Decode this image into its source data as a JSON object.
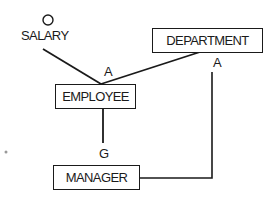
{
  "diagram": {
    "type": "entity-relationship",
    "entities": [
      {
        "id": "department",
        "label": "DEPARTMENT"
      },
      {
        "id": "employee",
        "label": "EMPLOYEE"
      },
      {
        "id": "manager",
        "label": "MANAGER"
      }
    ],
    "attributes": [
      {
        "id": "salary",
        "label": "SALARY",
        "symbol": "circle"
      }
    ],
    "relationships": [
      {
        "from": "salary",
        "to": "employee",
        "label": ""
      },
      {
        "from": "department",
        "to": "employee",
        "label": "A"
      },
      {
        "from": "employee",
        "to": "manager",
        "label": "G"
      },
      {
        "from": "manager",
        "to": "department",
        "label": "A"
      }
    ],
    "labels": {
      "employee_link": "A",
      "generalization": "G",
      "department_link": "A"
    },
    "colors": {
      "stroke": "#1a1a1a",
      "background": "#ffffff"
    }
  }
}
